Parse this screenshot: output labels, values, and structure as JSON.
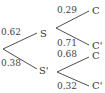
{
  "diagram": {
    "type": "probability-tree",
    "root": {
      "branches": [
        {
          "probability": "0.62",
          "event": "S",
          "branches": [
            {
              "probability": "0.29",
              "event": "C"
            },
            {
              "probability": "0.71",
              "event": "C'"
            }
          ]
        },
        {
          "probability": "0.38",
          "event": "S'",
          "branches": [
            {
              "probability": "0.68",
              "event": "C"
            },
            {
              "probability": "0.32",
              "event": "C'"
            }
          ]
        }
      ]
    },
    "line_color": "#3a3a3a"
  }
}
